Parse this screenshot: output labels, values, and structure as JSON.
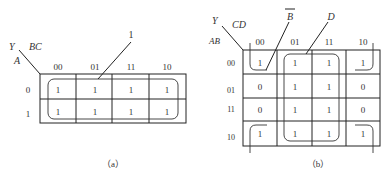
{
  "map_a": {
    "caption": "（a）",
    "output_label": "Y",
    "row_var": "A",
    "col_var": "BC",
    "col_headers": [
      "00",
      "01",
      "11",
      "10"
    ],
    "row_headers": [
      "0",
      "1"
    ],
    "cells": [
      [
        "1",
        "1",
        "1",
        "1"
      ],
      [
        "1",
        "1",
        "1",
        "1"
      ]
    ],
    "loop_labels": [
      "1"
    ]
  },
  "map_b": {
    "caption": "（b）",
    "output_label": "Y",
    "row_var": "AB",
    "col_var": "CD",
    "col_headers": [
      "00",
      "01",
      "11",
      "10"
    ],
    "row_headers": [
      "00",
      "01",
      "11",
      "10"
    ],
    "cells": [
      [
        "1",
        "1",
        "1",
        "1"
      ],
      [
        "0",
        "1",
        "1",
        "0"
      ],
      [
        "0",
        "1",
        "1",
        "0"
      ],
      [
        "1",
        "1",
        "1",
        "1"
      ]
    ],
    "loop_labels": [
      "B",
      "D"
    ]
  }
}
